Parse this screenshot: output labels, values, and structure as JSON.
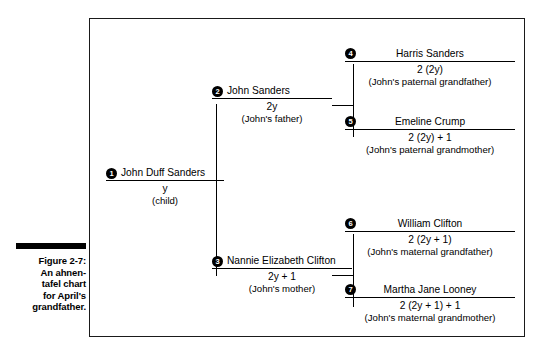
{
  "caption": {
    "figure_number": "Figure 2-7:",
    "lines": [
      "An ahnen-",
      "tafel chart",
      "for April's",
      "grandfather."
    ]
  },
  "chart": {
    "type": "ahnentafel-chart",
    "people": [
      {
        "number": "1",
        "name": "John Duff Sanders",
        "formula": "y",
        "relation": "(child)"
      },
      {
        "number": "2",
        "name": "John Sanders",
        "formula": "2y",
        "relation": "(John's father)"
      },
      {
        "number": "3",
        "name": "Nannie Elizabeth Clifton",
        "formula": "2y + 1",
        "relation": "(John's mother)"
      },
      {
        "number": "4",
        "name": "Harris Sanders",
        "formula": "2 (2y)",
        "relation": "(John's paternal grandfather)"
      },
      {
        "number": "5",
        "name": "Emeline Crump",
        "formula": "2 (2y) + 1",
        "relation": "(John's paternal grandmother)"
      },
      {
        "number": "6",
        "name": "William Clifton",
        "formula": "2 (2y + 1)",
        "relation": "(John's maternal grandfather)"
      },
      {
        "number": "7",
        "name": "Martha Jane Looney",
        "formula": "2 (2y + 1) + 1",
        "relation": "(John's maternal grandmother)"
      }
    ]
  },
  "colors": {
    "ink": "#000000",
    "frame": "#1a1a1a",
    "page": "#ffffff"
  }
}
